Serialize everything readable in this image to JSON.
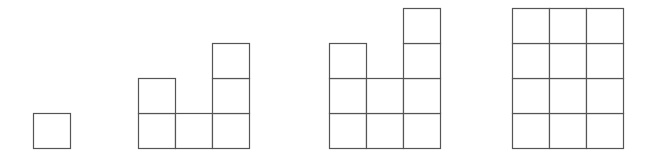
{
  "diagram": {
    "stroke_color": "#555555",
    "fill_color": "#ffffff",
    "cell_width": 37,
    "cell_height": 35,
    "baseline_y": 148,
    "figures": [
      {
        "name": "figure-1",
        "x": 33,
        "column_heights": [
          1
        ]
      },
      {
        "name": "figure-2",
        "x": 138,
        "column_heights": [
          2,
          1,
          3
        ]
      },
      {
        "name": "figure-3",
        "x": 329,
        "column_heights": [
          3,
          2,
          4
        ]
      },
      {
        "name": "figure-4",
        "x": 512,
        "column_heights": [
          4,
          4,
          4
        ]
      }
    ]
  }
}
